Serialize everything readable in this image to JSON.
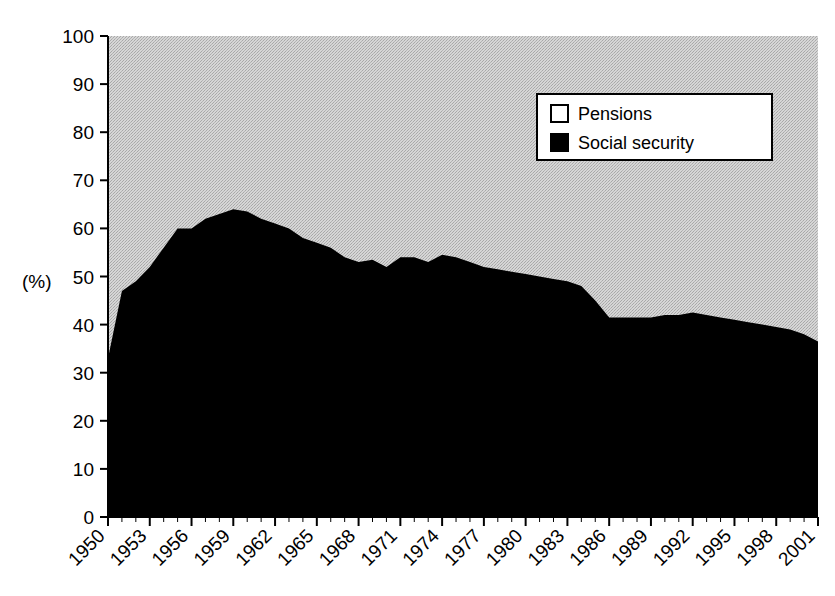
{
  "chart_data": {
    "type": "area",
    "stacked": true,
    "title": "",
    "subtitle": "",
    "xlabel": "",
    "ylabel": "(%)",
    "ylim": [
      0,
      100
    ],
    "ytick_step": 10,
    "yticks": [
      0,
      10,
      20,
      30,
      40,
      50,
      60,
      70,
      80,
      90,
      100
    ],
    "xticks": [
      "1950",
      "1953",
      "1956",
      "1959",
      "1962",
      "1965",
      "1968",
      "1971",
      "1974",
      "1977",
      "1980",
      "1983",
      "1986",
      "1989",
      "1992",
      "1995",
      "1998",
      "2001"
    ],
    "xtick_step": 3,
    "xlim": [
      1950,
      2001
    ],
    "grid": false,
    "legend_position": "top-right",
    "x": [
      1950,
      1951,
      1952,
      1953,
      1954,
      1955,
      1956,
      1957,
      1958,
      1959,
      1960,
      1961,
      1962,
      1963,
      1964,
      1965,
      1966,
      1967,
      1968,
      1969,
      1970,
      1971,
      1972,
      1973,
      1974,
      1975,
      1976,
      1977,
      1978,
      1979,
      1980,
      1981,
      1982,
      1983,
      1984,
      1985,
      1986,
      1987,
      1988,
      1989,
      1990,
      1991,
      1992,
      1993,
      1994,
      1995,
      1996,
      1997,
      1998,
      1999,
      2000,
      2001
    ],
    "series": [
      {
        "name": "Social security",
        "color": "#000000",
        "values": [
          33,
          47,
          49,
          52,
          56,
          60,
          60,
          62,
          63,
          64,
          63.5,
          62,
          61,
          60,
          58,
          57,
          56,
          54,
          53,
          53.5,
          52,
          54,
          54,
          53,
          54.5,
          54,
          53,
          52,
          51.5,
          51,
          50.5,
          50,
          49.5,
          49,
          48,
          45,
          41.5,
          41.5,
          41.5,
          41.5,
          42,
          42,
          42.5,
          42,
          41.5,
          41,
          40.5,
          40,
          39.5,
          39,
          38,
          36.5
        ]
      },
      {
        "name": "Pensions",
        "color": "#c8c8c8",
        "values": [
          67,
          53,
          51,
          48,
          44,
          40,
          40,
          38,
          37,
          36,
          36.5,
          38,
          39,
          40,
          42,
          43,
          44,
          46,
          47,
          46.5,
          48,
          46,
          46,
          47,
          45.5,
          46,
          47,
          48,
          48.5,
          49,
          49.5,
          50,
          50.5,
          51,
          52,
          55,
          58.5,
          58.5,
          58.5,
          58.5,
          58,
          58,
          57.5,
          58,
          58.5,
          59,
          59.5,
          60,
          60.5,
          61,
          62,
          63.5
        ]
      }
    ],
    "legend": [
      {
        "label": "Pensions",
        "swatch": "#ffffff",
        "swatch_border": "#000000"
      },
      {
        "label": "Social security",
        "swatch": "#000000",
        "swatch_border": "#000000"
      }
    ]
  },
  "axes": {
    "y_unit": "(%)"
  },
  "colors": {
    "plot_background": "#c8c8c8",
    "series_dark": "#000000",
    "axis": "#000000",
    "page_background": "#ffffff"
  }
}
